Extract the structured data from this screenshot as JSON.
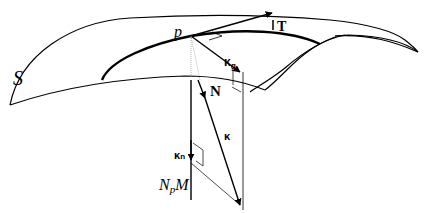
{
  "diagram": {
    "labels": {
      "surface": "S",
      "point": "p",
      "tangent": "T",
      "normal": "N",
      "curvature": "κ",
      "geodesic_curvature": "κ",
      "geodesic_subscript": "g",
      "normal_curvature": "κ",
      "normal_subscript": "n",
      "normal_line_N": "N",
      "normal_line_sub": "p",
      "normal_line_M": "M"
    },
    "colors": {
      "stroke": "#000000",
      "background": "#ffffff",
      "dotted": "#666666"
    }
  }
}
